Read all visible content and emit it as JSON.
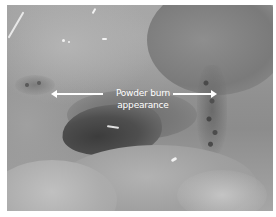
{
  "figure": {
    "annotation": {
      "line1": "Powder burn",
      "line2": "appearance",
      "arrows": [
        "left-arrow",
        "right-arrow"
      ]
    },
    "colors": {
      "annotation": "#ffffff",
      "border": "#ffffff",
      "vignette": "#000000"
    }
  }
}
